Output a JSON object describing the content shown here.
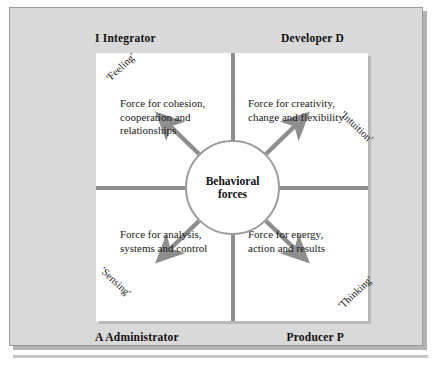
{
  "figure": {
    "kind": "quadrant-diagram"
  },
  "poles": {
    "top_left": "I  Integrator",
    "top_right": "Developer  D",
    "bottom_left": "A  Administrator",
    "bottom_right": "Producer  P"
  },
  "hub": {
    "label": "Behavioral\nforces"
  },
  "quadrants": [
    {
      "id": "integrator",
      "position": "top-left",
      "function_label": "'Feeling'",
      "force_text": "Force for cohesion,\ncooperation and\nrelationships",
      "pole": "I  Integrator"
    },
    {
      "id": "developer",
      "position": "top-right",
      "function_label": "'Intuition'",
      "force_text": "Force for creativity,\nchange and flexibility",
      "pole": "Developer  D"
    },
    {
      "id": "administrator",
      "position": "bottom-left",
      "function_label": "'Sensing'",
      "force_text": "Force for analysis,\nsystems and control",
      "pole": "A  Administrator"
    },
    {
      "id": "producer",
      "position": "bottom-right",
      "function_label": "'Thinking'",
      "force_text": "Force for energy,\naction and results",
      "pole": "Producer  P"
    }
  ],
  "colors": {
    "plate_background": "#d9d9d9",
    "plate_border": "#9a9a9a",
    "canvas_background": "#ffffff",
    "divider": "#8e8e8e",
    "circle_stroke": "#9c9c9c",
    "arrow": "#8e8e8e",
    "text": "#1a1a1a",
    "shadow": "#b4b4b4"
  }
}
